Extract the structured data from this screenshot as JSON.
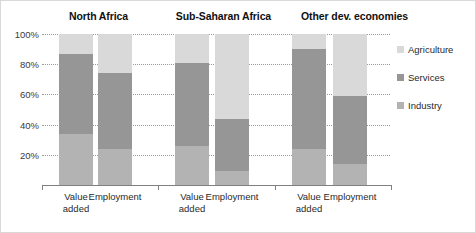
{
  "chart_data": {
    "type": "bar",
    "subtype": "stacked-100-percent",
    "title": "",
    "xlabel": "",
    "ylabel": "",
    "ylim": [
      0,
      100
    ],
    "ytick_labels": [
      "20%",
      "40%",
      "60%",
      "80%",
      "100%"
    ],
    "ytick_values": [
      20,
      40,
      60,
      80,
      100
    ],
    "grid": true,
    "legend_position": "right",
    "groups": [
      "North Africa",
      "Sub-Saharan Africa",
      "Other dev. economies"
    ],
    "categories": [
      "Value added",
      "Employment",
      "Value added",
      "Employment",
      "Value added",
      "Employment"
    ],
    "series": [
      {
        "name": "Agriculture",
        "color": "#d9d9d9",
        "values": [
          13,
          26,
          19,
          56,
          10,
          41
        ]
      },
      {
        "name": "Services",
        "color": "#969696",
        "values": [
          53,
          50,
          55,
          35,
          66,
          45
        ]
      },
      {
        "name": "Industry",
        "color": "#b3b3b3",
        "values": [
          34,
          24,
          26,
          9,
          24,
          14
        ]
      }
    ],
    "stack_order_top_to_bottom": [
      "Agriculture",
      "Services",
      "Industry"
    ]
  },
  "legend": {
    "items": [
      {
        "label": "Agriculture",
        "color": "#d9d9d9"
      },
      {
        "label": "Services",
        "color": "#969696"
      },
      {
        "label": "Industry",
        "color": "#b3b3b3"
      }
    ]
  },
  "axis": {
    "y_ticks": [
      {
        "label": "100%",
        "value": 100
      },
      {
        "label": "80%",
        "value": 80
      },
      {
        "label": "60%",
        "value": 60
      },
      {
        "label": "40%",
        "value": 40
      },
      {
        "label": "20%",
        "value": 20
      }
    ],
    "x_labels": [
      "Value\nadded",
      "Employment",
      "Value\nadded",
      "Employment",
      "Value\nadded",
      "Employment"
    ]
  },
  "groups": [
    {
      "title": "North Africa"
    },
    {
      "title": "Sub-Saharan Africa"
    },
    {
      "title": "Other dev. economies"
    }
  ],
  "colors": {
    "agriculture": "#d9d9d9",
    "services": "#969696",
    "industry": "#b3b3b3",
    "gridline": "#9a9a9a",
    "axis": "#808080",
    "text": "#2a2a2a",
    "background": "#ffffff",
    "border": "#d9d9d9"
  }
}
